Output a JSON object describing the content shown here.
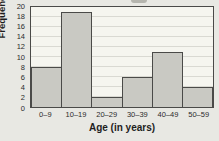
{
  "page": {
    "background": "#e8e8e3"
  },
  "chart_data": {
    "type": "bar",
    "title": "",
    "categories": [
      "0–9",
      "10–19",
      "20–29",
      "30–39",
      "40–49",
      "50–59"
    ],
    "values": [
      8,
      19,
      2,
      6,
      11,
      4
    ],
    "xlabel": "Age (in years)",
    "ylabel": "Frequency",
    "ylim": [
      0,
      20
    ],
    "ytick_step": 2,
    "grid": true,
    "legend": "none",
    "colors": {
      "bar_fill": "#c9c9c3",
      "bar_border": "#4a4a48",
      "plot_background": "#f5f5ef",
      "gridline": "#d9d9d2",
      "axis_frame": "#4a4a48",
      "text": "#1e1e1e"
    }
  }
}
